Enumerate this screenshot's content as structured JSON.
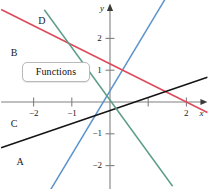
{
  "figure": {
    "width": 212,
    "height": 189,
    "background": "#ffffff"
  },
  "callout": {
    "label": "Functions"
  },
  "axes": {
    "x_axis_label": "x",
    "y_axis_label": "y",
    "origin_px": {
      "x": 110,
      "y": 102
    },
    "unit_px": {
      "x": 38.2,
      "y": 31.8
    },
    "xlim": [
      -2.85,
      2.55
    ],
    "ylim": [
      -2.75,
      3.1
    ],
    "x_ticks": [
      {
        "value": -2,
        "label": "−2",
        "labeled": true
      },
      {
        "value": -1,
        "label": "−1",
        "labeled": true
      },
      {
        "value": 1,
        "label": "",
        "labeled": false
      },
      {
        "value": 2,
        "label": "2",
        "labeled": true
      }
    ],
    "y_ticks": [
      {
        "value": 2,
        "label": "2",
        "labeled": true
      },
      {
        "value": 1,
        "label": "1",
        "labeled": true
      },
      {
        "value": -1,
        "label": "−1",
        "labeled": true
      },
      {
        "value": -2,
        "label": "−2",
        "labeled": true
      }
    ],
    "axis_color": "#808080",
    "tick_color": "#808080"
  },
  "chart_data": {
    "type": "line",
    "title": "",
    "xlabel": "x",
    "ylabel": "y",
    "xlim": [
      -2.85,
      2.55
    ],
    "ylim": [
      -2.75,
      3.1
    ],
    "grid": false,
    "legend": "inline-labels",
    "series": [
      {
        "name": "A",
        "label": "A",
        "color": "#5b93cc",
        "slope": 2.0,
        "intercept": 0.35,
        "equation": "y = 2x + 0.35",
        "points": [
          [
            -1.55,
            -2.75
          ],
          [
            2.35,
            5.05
          ]
        ],
        "label_pos": {
          "x": -2.45,
          "y": -1.9
        }
      },
      {
        "name": "B",
        "label": "B",
        "color": "#e0485a",
        "slope": -0.6,
        "intercept": 1.2,
        "equation": "y = −0.6x + 1.2",
        "points": [
          [
            -2.85,
            2.91
          ],
          [
            2.55,
            -0.33
          ]
        ],
        "label_pos": {
          "x": -2.6,
          "y": 1.55
        }
      },
      {
        "name": "C",
        "label": "C",
        "color": "#141414",
        "slope": 0.41,
        "intercept": -0.27,
        "equation": "y = 0.41x − 0.27",
        "points": [
          [
            -2.85,
            -1.44
          ],
          [
            2.55,
            0.78
          ]
        ],
        "label_pos": {
          "x": -2.6,
          "y": -0.68
        }
      },
      {
        "name": "D",
        "label": "D",
        "color": "#5d9e8a",
        "slope": -1.65,
        "intercept": 0.05,
        "equation": "y = −1.65x + 0.05",
        "points": [
          [
            -1.72,
            2.9
          ],
          [
            1.64,
            -2.65
          ]
        ],
        "label_pos": {
          "x": -1.88,
          "y": 2.55
        }
      }
    ]
  }
}
